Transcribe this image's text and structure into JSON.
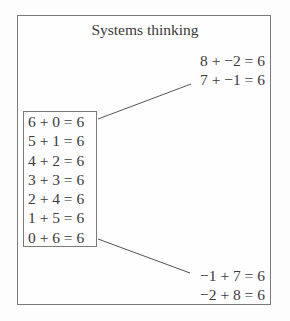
{
  "title": "Systems thinking",
  "top_equations": [
    "8 + −2 = 6",
    "7 + −1 = 6"
  ],
  "boxed_equations": [
    "6 + 0 = 6",
    "5 + 1 = 6",
    "4 + 2 = 6",
    "3 + 3 = 6",
    "2 + 4 = 6",
    "1 + 5 = 6",
    "0 + 6 = 6"
  ],
  "bottom_equations": [
    "−1 + 7 = 6",
    "−2 + 8 = 6"
  ],
  "colors": {
    "border": "#7a7a7a",
    "text": "#3a3a3a",
    "background": "#fdfdfd"
  }
}
